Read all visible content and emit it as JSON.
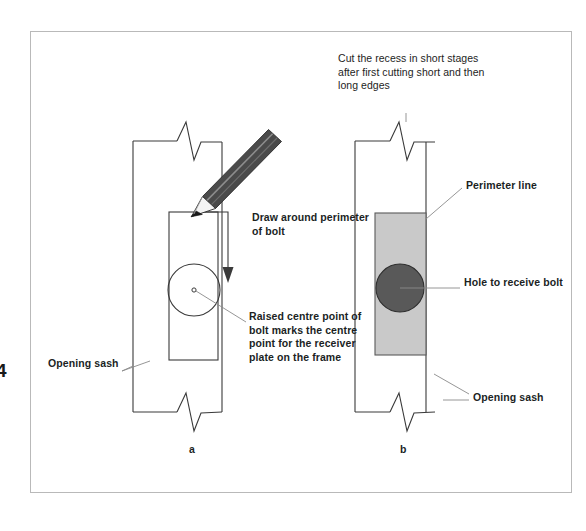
{
  "figure": {
    "caption_a": "a",
    "caption_b": "b",
    "page_number_fragment": "4"
  },
  "labels": {
    "cut_recess": "Cut the recess in short stages after first cutting short and then long edges",
    "draw_around": "Draw around perimeter of bolt",
    "raised_centre": "Raised centre point of bolt marks the centre point for the receiver plate on the frame",
    "opening_sash_left": "Opening sash",
    "perimeter_line": "Perimeter line",
    "hole_to_receive": "Hole to receive bolt",
    "opening_sash_right": "Opening sash"
  },
  "icons": {
    "pencil": "pencil-icon",
    "arrow": "down-arrow-icon",
    "break_line": "break-line-icon",
    "bolt_circle": "bolt-circle-icon",
    "centre_point": "centre-point-icon",
    "recess": "recess-icon",
    "hole": "hole-icon"
  },
  "colors": {
    "line": "#3a3a3a",
    "page_border": "#b9b9b9",
    "recess_fill": "#c9c9c9",
    "recess_stroke": "#5a5a5a",
    "hole_fill": "#595959",
    "hole_stroke": "#2f2f2f",
    "pencil_body": "#4a4a4a",
    "pencil_highlight": "#7d7d7d",
    "pencil_wood": "#f2f2f2",
    "pencil_tip": "#1a1a1a",
    "leader": "#8a8a8a",
    "text": "#201f1f",
    "background": "#ffffff"
  }
}
